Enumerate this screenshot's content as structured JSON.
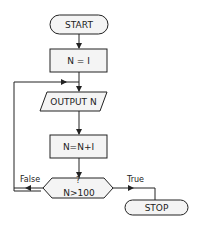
{
  "flowchart": {
    "start": {
      "label": "START"
    },
    "init": {
      "label": "N = I"
    },
    "output": {
      "label": "OUTPUT N"
    },
    "increment": {
      "label": "N=N+I"
    },
    "decision": {
      "question_mark": "?",
      "label": "N>100"
    },
    "false_label": "False",
    "true_label": "True",
    "stop": {
      "label": "STOP"
    }
  },
  "colors": {
    "stroke": "#222222",
    "box_fill": "#f4f4f4",
    "background": "#ffffff"
  }
}
